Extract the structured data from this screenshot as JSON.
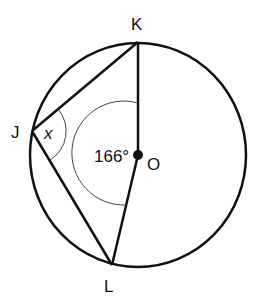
{
  "diagram": {
    "type": "circle-geometry",
    "circle": {
      "center_label": "O",
      "cx": 138,
      "cy": 155,
      "rx": 108,
      "ry": 112
    },
    "points": {
      "K": {
        "label": "K",
        "x": 138,
        "y": 42,
        "label_x": 131,
        "label_y": 30
      },
      "J": {
        "label": "J",
        "x": 32,
        "y": 131,
        "label_x": 11,
        "label_y": 138
      },
      "L": {
        "label": "L",
        "x": 112,
        "y": 265,
        "label_x": 104,
        "label_y": 292
      },
      "O": {
        "label": "O",
        "x": 138,
        "y": 155,
        "label_x": 147,
        "label_y": 170
      }
    },
    "segments": [
      "JK",
      "JL",
      "OK",
      "OL"
    ],
    "angles": {
      "central": {
        "vertex": "O",
        "value_label": "166°"
      },
      "inscribed": {
        "vertex": "J",
        "value_label": "x"
      }
    },
    "colors": {
      "stroke": "#111111",
      "arc": "#444444",
      "background": "#ffffff"
    }
  }
}
